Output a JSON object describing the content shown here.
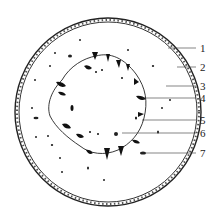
{
  "figure": {
    "type": "stem-cross-section",
    "labels": [
      {
        "num": "1",
        "y": 48
      },
      {
        "num": "2",
        "y": 67
      },
      {
        "num": "3",
        "y": 86
      },
      {
        "num": "4",
        "y": 98
      },
      {
        "num": "5",
        "y": 120
      },
      {
        "num": "6",
        "y": 133
      },
      {
        "num": "7",
        "y": 153
      }
    ]
  }
}
